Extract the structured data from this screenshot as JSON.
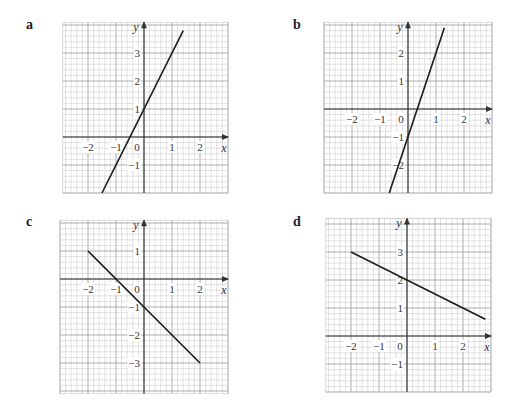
{
  "chart_data": [
    {
      "type": "line",
      "panel": "a",
      "title": "a",
      "xlabel": "x",
      "ylabel": "y",
      "equation": "y = 2x + 1",
      "xlim": [
        -2.9,
        3.0
      ],
      "ylim": [
        -2.0,
        4.1
      ],
      "origin_px": [
        144,
        137
      ],
      "xticks": [
        -2,
        -1,
        0,
        1,
        2
      ],
      "yticks": [
        -1,
        1,
        2,
        3
      ],
      "grid": true,
      "points": [
        [
          -1.5,
          -2.0
        ],
        [
          1.4,
          3.8
        ]
      ]
    },
    {
      "type": "line",
      "panel": "b",
      "title": "b",
      "xlabel": "x",
      "ylabel": "y",
      "equation": "y = 3x - 1",
      "xlim": [
        -3.0,
        3.0
      ],
      "ylim": [
        -3.0,
        3.1
      ],
      "origin_px": [
        408,
        109
      ],
      "xticks": [
        -2,
        -1,
        0,
        1,
        2
      ],
      "yticks": [
        -2,
        -1,
        1,
        2
      ],
      "grid": true,
      "points": [
        [
          -0.67,
          -3.0
        ],
        [
          1.3,
          2.9
        ]
      ]
    },
    {
      "type": "line",
      "panel": "c",
      "title": "c",
      "xlabel": "x",
      "ylabel": "y",
      "equation": "y = -x - 1",
      "xlim": [
        -3.0,
        3.0
      ],
      "ylim": [
        -4.1,
        2.1
      ],
      "origin_px": [
        144,
        279
      ],
      "xticks": [
        -2,
        -1,
        0,
        1,
        2
      ],
      "yticks": [
        -3,
        -2,
        -1,
        1
      ],
      "grid": true,
      "points": [
        [
          -2.0,
          1.0
        ],
        [
          2.0,
          -3.0
        ]
      ]
    },
    {
      "type": "line",
      "panel": "d",
      "title": "d",
      "xlabel": "x",
      "ylabel": "y",
      "equation": "y = -0.5x + 2",
      "xlim": [
        -2.9,
        3.0
      ],
      "ylim": [
        -2.0,
        4.2
      ],
      "origin_px": [
        407,
        336
      ],
      "xticks": [
        -2,
        -1,
        0,
        1,
        2
      ],
      "yticks": [
        -1,
        1,
        2,
        3
      ],
      "grid": true,
      "points": [
        [
          -2.0,
          3.0
        ],
        [
          2.8,
          0.6
        ]
      ]
    }
  ],
  "panels": {
    "a": {
      "label": "a",
      "label_pos": [
        26,
        17
      ]
    },
    "b": {
      "label": "b",
      "label_pos": [
        293,
        17
      ]
    },
    "c": {
      "label": "c",
      "label_pos": [
        26,
        214
      ]
    },
    "d": {
      "label": "d",
      "label_pos": [
        293,
        214
      ]
    }
  },
  "style": {
    "unit_px": 28,
    "minor_divisions": 5,
    "minor_color": "#c4c4c4",
    "major_color": "#9a9a9a",
    "axis_color": "#333333",
    "line_color": "#1a1a1a"
  }
}
